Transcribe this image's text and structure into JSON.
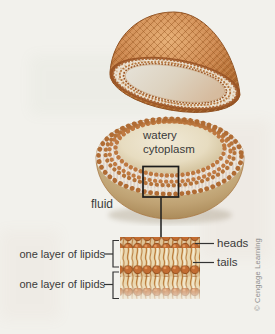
{
  "labels": {
    "watery_cytoplasm": "watery cytoplasm",
    "fluid": "fluid",
    "heads": "heads",
    "tails": "tails",
    "lipid_layer_top": "one layer of lipids",
    "lipid_layer_bottom": "one layer of lipids"
  },
  "credit": "© Cengage Learning",
  "colors": {
    "background": "#f2f1ec",
    "membrane_head_orange": "#c0763c",
    "cap_weave_orange": "#cd8850",
    "bowl_beige": "#d4c094",
    "cytoplasm_cream": "#e7dcc0",
    "tails_cream": "#ead8b0",
    "label_text": "#3a3a3a",
    "credit_text": "#8f8f8f",
    "callout_line": "#1c1c1c"
  }
}
